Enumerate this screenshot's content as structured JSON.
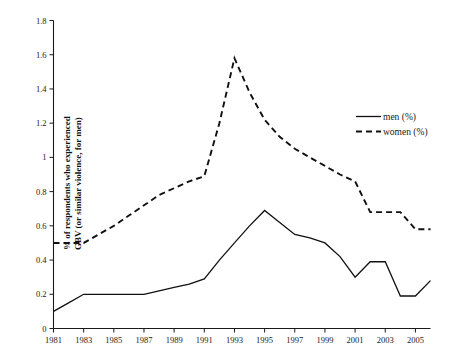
{
  "chart_data": {
    "type": "line",
    "title": "",
    "xlabel": "",
    "ylabel": "% of respondents who experienced GBV (or similar violence, for men)",
    "xlim": [
      1981,
      2006
    ],
    "ylim": [
      0,
      1.8
    ],
    "grid": false,
    "legend_position": "right",
    "x": [
      1981,
      1982,
      1983,
      1984,
      1985,
      1986,
      1987,
      1988,
      1989,
      1990,
      1991,
      1992,
      1993,
      1994,
      1995,
      1996,
      1997,
      1998,
      1999,
      2000,
      2001,
      2002,
      2003,
      2004,
      2005,
      2006
    ],
    "series": [
      {
        "name": "men (%)",
        "style": "solid",
        "values": [
          0.1,
          0.15,
          0.2,
          0.2,
          0.2,
          0.2,
          0.2,
          0.22,
          0.24,
          0.26,
          0.29,
          0.4,
          0.5,
          0.6,
          0.69,
          0.62,
          0.55,
          0.53,
          0.5,
          0.42,
          0.3,
          0.39,
          0.39,
          0.19,
          0.19,
          0.28
        ]
      },
      {
        "name": "women (%)",
        "style": "dashed",
        "values": [
          0.5,
          0.5,
          0.5,
          0.55,
          0.6,
          0.66,
          0.72,
          0.78,
          0.82,
          0.86,
          0.89,
          1.2,
          1.58,
          1.38,
          1.22,
          1.12,
          1.05,
          1.0,
          0.95,
          0.9,
          0.86,
          0.68,
          0.68,
          0.68,
          0.58,
          0.58
        ]
      }
    ],
    "y_ticks": [
      0,
      0.2,
      0.4,
      0.6,
      0.8,
      1,
      1.2,
      1.4,
      1.6,
      1.8
    ],
    "y_tick_labels": [
      "0",
      "0.2",
      "0.4",
      "0.6",
      "0.8",
      "1",
      "1.2",
      "1.4",
      "1.6",
      "1.8"
    ],
    "x_ticks": [
      1981,
      1983,
      1985,
      1987,
      1989,
      1991,
      1993,
      1995,
      1997,
      1999,
      2001,
      2003,
      2005
    ],
    "x_tick_labels": [
      "1981",
      "1983",
      "1985",
      "1987",
      "1989",
      "1991",
      "1993",
      "1995",
      "1997",
      "1999",
      "2001",
      "2003",
      "2005"
    ],
    "colors": {
      "men": "#111111",
      "women": "#111111",
      "axis": "#1a1a1a",
      "background": "#ffffff"
    }
  },
  "axis": {
    "y_title": "% of respondents who experienced GBV (or similar violence, for men)",
    "y_title_line1": "% of respondents who experienced",
    "y_title_line2": "GBV (or similar violence, for men)"
  },
  "legend": {
    "items": [
      {
        "label": "men (%)",
        "style": "solid"
      },
      {
        "label": "women (%)",
        "style": "dashed"
      }
    ]
  },
  "caption": {
    "text": ""
  }
}
